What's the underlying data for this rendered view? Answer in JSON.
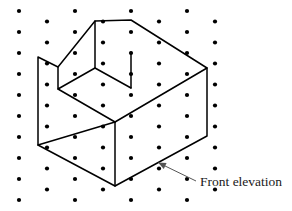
{
  "figure": {
    "kind": "isometric-solid-on-dot-grid",
    "background_color": "#ffffff",
    "dot_color": "#000000",
    "edge_color": "#000000",
    "leader_color": "#555555",
    "text_color": "#1a1a1a"
  },
  "grid": {
    "name": "isometric-dot-lattice",
    "columns": 8,
    "rows": 10,
    "column_spacing": 28,
    "row_spacing": 21,
    "column_offset": 10.5,
    "origin_x": 19,
    "origin_y": 11,
    "dot_radius": 2.1
  },
  "solid": {
    "description": "Rectangular block with a rectangular step notch cut from the upper left",
    "outline_points": "95,21 131,20 207,68 207,136 115,186 38,145 38,57 58,67 58,89 95,68",
    "outline_closed": true,
    "internal_edges": [
      {
        "name": "center-vertical-edge",
        "points": "115,122 115,186"
      },
      {
        "name": "left-lower-diagonal",
        "points": "38,145 115,122"
      },
      {
        "name": "right-upper-diagonal",
        "points": "115,122 207,68"
      },
      {
        "name": "notch-floor-diagonal",
        "points": "58,89 115,122"
      },
      {
        "name": "notch-top-diagonal",
        "points": "95,68 131,88"
      },
      {
        "name": "notch-inner-vertical",
        "points": "131,88 131,52"
      },
      {
        "name": "notch-back-diagonal",
        "points": "58,67 95,21"
      }
    ]
  },
  "annotation": {
    "label": "Front elevation",
    "label_x": 200,
    "label_y": 186,
    "leader_points": "196,181 161,164",
    "arrow_tip_x": 158,
    "arrow_tip_y": 162.5,
    "points_to_face": "front-right-face"
  }
}
